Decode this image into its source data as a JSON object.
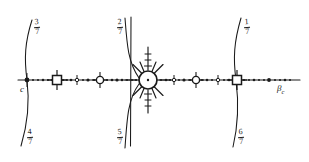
{
  "figure": {
    "background_color": "#ffffff",
    "ink_color": "#1a1a1a",
    "width": 309,
    "height": 162
  },
  "axis": {
    "name": "horizontal-parameter-line",
    "y": 80,
    "x_start": 18,
    "x_end": 300,
    "left_label": "c",
    "right_label": "β",
    "right_label_subscript": "c"
  },
  "arcs": [
    {
      "id": "arc-left",
      "x_at_axis": 27,
      "top_fraction": {
        "numerator": "3",
        "denominator": "7"
      },
      "bottom_fraction": {
        "numerator": "4",
        "denominator": "7"
      }
    },
    {
      "id": "arc-middle",
      "x_at_axis": 130,
      "top_fraction": {
        "numerator": "2",
        "denominator": "7"
      },
      "bottom_fraction": {
        "numerator": "5",
        "denominator": "7"
      }
    },
    {
      "id": "arc-right",
      "x_at_axis": 236,
      "top_fraction": {
        "numerator": "1",
        "denominator": "7"
      },
      "bottom_fraction": {
        "numerator": "6",
        "denominator": "7"
      }
    }
  ],
  "markers": {
    "squares": [
      {
        "id": "square-left",
        "x": 57
      },
      {
        "id": "square-right",
        "x": 237
      }
    ],
    "circles": [
      {
        "id": "circle-left",
        "x": 100
      },
      {
        "id": "circle-right",
        "x": 196
      }
    ],
    "starburst": {
      "id": "starburst-center",
      "x": 148,
      "radius": 9,
      "spokes": 12
    },
    "small_crosses": [
      {
        "x": 77
      },
      {
        "x": 174
      },
      {
        "x": 218
      }
    ],
    "endpoint_dot": {
      "id": "endpoint-c",
      "x": 27
    },
    "tick_dots_small": 66,
    "tick_dots_large": 14
  },
  "legend": {
    "note": "Fractions label the boundary arcs; solid dots mark parameter values on the β line."
  }
}
